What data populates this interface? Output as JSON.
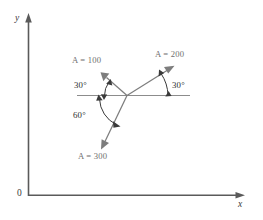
{
  "figure": {
    "axes": {
      "y_label": "y",
      "x_label": "x",
      "origin_label": "0"
    },
    "colors": {
      "axis": "#5a5a5a",
      "vector": "#7d7d7d",
      "reference_line": "#8c8c8c",
      "arc": "#3a3a3a",
      "label_text": "#6e6e6e",
      "angle_text": "#2e2e2e",
      "background": "#ffffff"
    },
    "vectors": [
      {
        "id": "vector-a100",
        "label": "A = 100",
        "magnitude": 100,
        "angle_deg_from_reference": 150,
        "direction": "up-left"
      },
      {
        "id": "vector-a200",
        "label": "A = 200",
        "magnitude": 200,
        "angle_deg_from_reference": 30,
        "direction": "up-right"
      },
      {
        "id": "vector-a300",
        "label": "A = 300",
        "magnitude": 300,
        "angle_deg_from_reference": 240,
        "direction": "down-left"
      }
    ],
    "angles": [
      {
        "id": "angle-left-30",
        "label": "30°",
        "value_deg": 30,
        "between": "A = 100 and reference line (left side)"
      },
      {
        "id": "angle-right-30",
        "label": "30°",
        "value_deg": 30,
        "between": "A = 200 and reference line (right side)"
      },
      {
        "id": "angle-60",
        "label": "60°",
        "value_deg": 60,
        "between": "reference line (left side) and A = 300"
      }
    ]
  }
}
